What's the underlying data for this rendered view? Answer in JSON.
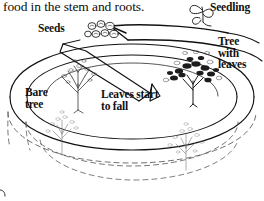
{
  "page": {
    "width": 264,
    "height": 201,
    "background_color": "#ffffff",
    "ink_color": "#111111"
  },
  "caption": {
    "text": "food in the stem and roots."
  },
  "labels": {
    "seeds": "Seeds",
    "seedling": "Seedling",
    "tree_with_leaves": "Tree\nwith\nleaves",
    "bare_tree": "Bare\ntree",
    "leaves_start_to_fall": "Leaves start\nto fall"
  },
  "diagram": {
    "type": "life-cycle",
    "subject": "tree",
    "stages": [
      "Seeds",
      "Seedling",
      "Tree with leaves",
      "Leaves start to fall",
      "Bare tree"
    ],
    "illustrations": [
      "seed-cluster",
      "seedling-sprout",
      "leafy-tree",
      "falling-leaves-tree",
      "bare-tree",
      "lower-tree-left",
      "lower-tree-right"
    ],
    "line_style": {
      "upper_bands": "solid",
      "lower_bands": "dashed",
      "stroke_color": "#111111"
    }
  }
}
